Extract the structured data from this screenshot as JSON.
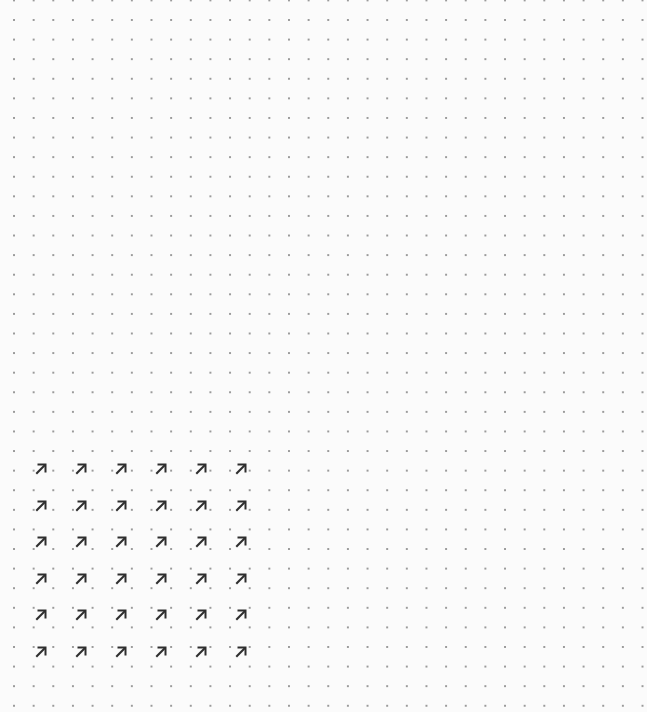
{
  "canvas": {
    "width": 647,
    "height": 712,
    "background": "#fbfbfb",
    "dot_color": "#9a9a9a",
    "dot_spacing_px": 19.6
  },
  "arrow_grid": {
    "icon": "arrow-up-right-icon",
    "glyph": "↗",
    "color": "#2e2e2e",
    "columns_x": [
      41,
      81,
      121,
      161,
      201,
      241
    ],
    "rows_y": [
      469,
      506,
      542,
      579,
      615,
      652
    ],
    "rows": 6,
    "columns": 6
  }
}
